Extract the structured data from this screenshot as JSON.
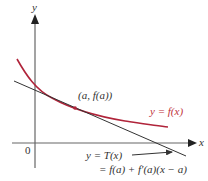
{
  "figure": {
    "axes": {
      "x_label": "x",
      "y_label": "y",
      "origin_label": "0"
    },
    "curve": {
      "label": "y = f(x)",
      "color": "#b0243a"
    },
    "tangent": {
      "label_line1": "y = T(x)",
      "label_line2": "= f(a) + f′(a)(x − a)",
      "color": "#333333"
    },
    "point": {
      "label": "(a, f(a))"
    },
    "colors": {
      "axis": "#555555",
      "curve": "#b0243a",
      "tangent": "#333333",
      "text": "#333333"
    }
  }
}
